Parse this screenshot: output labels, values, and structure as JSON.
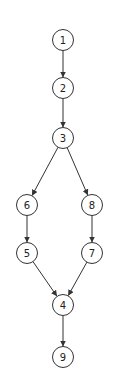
{
  "diagram": {
    "type": "directed-graph",
    "colors": {
      "stroke": "#333333",
      "text": "#222222",
      "background": "#ffffff"
    },
    "node_radius": 10.5,
    "nodes": [
      {
        "id": "1",
        "label": "1",
        "x": 63,
        "y": 40
      },
      {
        "id": "2",
        "label": "2",
        "x": 63,
        "y": 88
      },
      {
        "id": "3",
        "label": "3",
        "x": 63,
        "y": 138
      },
      {
        "id": "6",
        "label": "6",
        "x": 27,
        "y": 205
      },
      {
        "id": "8",
        "label": "8",
        "x": 92,
        "y": 205
      },
      {
        "id": "5",
        "label": "5",
        "x": 27,
        "y": 253
      },
      {
        "id": "7",
        "label": "7",
        "x": 92,
        "y": 253
      },
      {
        "id": "4",
        "label": "4",
        "x": 63,
        "y": 305
      },
      {
        "id": "9",
        "label": "9",
        "x": 63,
        "y": 357
      }
    ],
    "edges": [
      {
        "from": "1",
        "to": "2"
      },
      {
        "from": "2",
        "to": "3"
      },
      {
        "from": "3",
        "to": "6"
      },
      {
        "from": "3",
        "to": "8"
      },
      {
        "from": "6",
        "to": "5"
      },
      {
        "from": "8",
        "to": "7"
      },
      {
        "from": "5",
        "to": "4"
      },
      {
        "from": "7",
        "to": "4"
      },
      {
        "from": "4",
        "to": "9"
      }
    ]
  }
}
